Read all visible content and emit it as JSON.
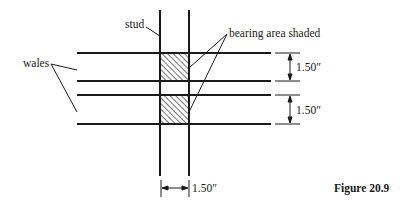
{
  "figure": {
    "caption": "Figure 20.9",
    "labels": {
      "stud": "stud",
      "wales": "wales",
      "bearing": "bearing area shaded"
    },
    "dimensions": {
      "wale_gap_top": "1.50″",
      "wale_gap_bottom": "1.50″",
      "stud_width": "1.50″"
    },
    "colors": {
      "line": "#1a1a1a",
      "background": "#ffffff"
    }
  }
}
